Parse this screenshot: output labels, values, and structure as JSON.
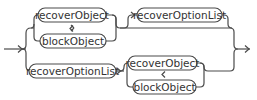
{
  "diagram": {
    "type": "railroad",
    "top_branch": {
      "loop": {
        "forward": "recoverObject",
        "back": "blockObject"
      },
      "optional": "recoverOptionList"
    },
    "bottom_branch": {
      "first": "recoverOptionList",
      "loop": {
        "forward": "recoverObject",
        "back": "blockObject"
      }
    }
  },
  "colors": {
    "stroke": "#4a4a4a",
    "text": "#333333",
    "background": "#ffffff"
  }
}
